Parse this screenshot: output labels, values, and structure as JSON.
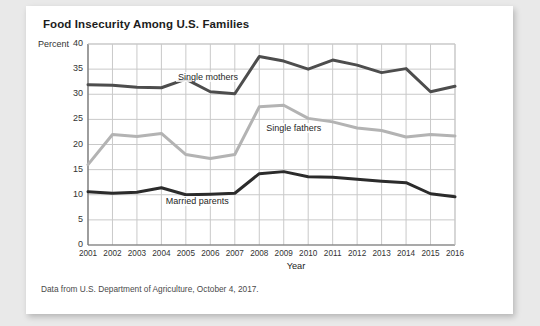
{
  "figure": {
    "title": "Food Insecurity Among U.S. Families",
    "unit_label": "Percent",
    "source_note": "Data from U.S. Department of Agriculture, October 4, 2017."
  },
  "colors": {
    "card_background": "#ffffff",
    "page_background": "#e9e9e9",
    "grid": "#c9c9c9",
    "axis": "#8a8a8a",
    "single_mothers": "#4d4d4d",
    "single_fathers": "#b3b3b3",
    "married_parents": "#2b2b2b",
    "text": "#1c1c1c"
  },
  "chart_data": {
    "type": "line",
    "title": "Food Insecurity Among U.S. Families",
    "xlabel": "Year",
    "ylabel": "Percent",
    "ylim": [
      0,
      40
    ],
    "ytick_values": [
      0,
      5,
      10,
      15,
      20,
      25,
      30,
      35,
      40
    ],
    "ytick_labels": [
      "0",
      "5",
      "10",
      "15",
      "20",
      "25",
      "30",
      "35",
      "40"
    ],
    "grid": true,
    "legend_position": "inline-annotations",
    "categories": [
      2001,
      2002,
      2003,
      2004,
      2005,
      2006,
      2007,
      2008,
      2009,
      2010,
      2011,
      2012,
      2013,
      2014,
      2015,
      2016
    ],
    "xtick_labels": [
      "2001",
      "2002",
      "2003",
      "2004",
      "2005",
      "2006",
      "2007",
      "2008",
      "2009",
      "2010",
      "2011",
      "2012",
      "2013",
      "2014",
      "2015",
      "2016"
    ],
    "series": [
      {
        "name": "Single mothers",
        "color": "#4d4d4d",
        "values": [
          31.9,
          31.8,
          31.4,
          31.3,
          33.0,
          30.5,
          30.1,
          37.5,
          36.6,
          35.0,
          36.8,
          35.8,
          34.3,
          35.1,
          30.5,
          31.6
        ]
      },
      {
        "name": "Single fathers",
        "color": "#b3b3b3",
        "values": [
          16.0,
          22.0,
          21.6,
          22.2,
          18.0,
          17.2,
          18.0,
          27.5,
          27.8,
          25.2,
          24.5,
          23.3,
          22.8,
          21.5,
          22.0,
          21.7
        ]
      },
      {
        "name": "Married parents",
        "color": "#2b2b2b",
        "values": [
          10.6,
          10.3,
          10.5,
          11.4,
          10.0,
          10.1,
          10.3,
          14.2,
          14.6,
          13.6,
          13.5,
          13.1,
          12.7,
          12.4,
          10.2,
          9.6
        ]
      }
    ],
    "annotations": [
      {
        "text": "Single mothers",
        "x": 2004.6,
        "y": 33.3
      },
      {
        "text": "Single fathers",
        "x": 2008.2,
        "y": 23.1
      },
      {
        "text": "Married parents",
        "x": 2004.1,
        "y": 8.6
      }
    ]
  }
}
